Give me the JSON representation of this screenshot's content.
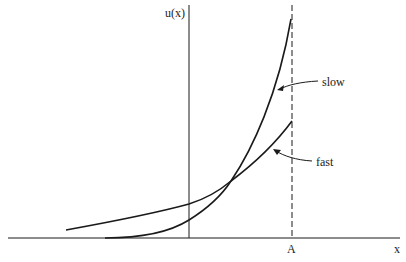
{
  "diagram": {
    "y_axis_label": "u(x)",
    "x_axis_label": "x",
    "boundary_label": "A",
    "curves": [
      {
        "name": "slow",
        "label": "slow"
      },
      {
        "name": "fast",
        "label": "fast"
      }
    ],
    "colors": {
      "ink": "#1a1a1a",
      "background": "#ffffff"
    }
  }
}
